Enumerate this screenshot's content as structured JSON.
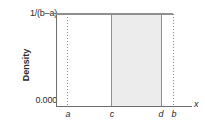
{
  "chart_data": {
    "type": "area",
    "title": "",
    "xlabel": "x",
    "ylabel": "Density",
    "ylim": [
      0,
      1
    ],
    "xlim": [
      0,
      1
    ],
    "grid": false,
    "legend": null,
    "y_ticks": [
      {
        "value": 0,
        "label": "0.000"
      },
      {
        "value": 1,
        "label": "1/(b–a)"
      }
    ],
    "x_ticks": [
      {
        "key": "a",
        "label": "a",
        "position": 0.09
      },
      {
        "key": "c",
        "label": "c",
        "position": 0.42
      },
      {
        "key": "d",
        "label": "d",
        "position": 0.79
      },
      {
        "key": "b",
        "label": "b",
        "position": 0.88
      }
    ],
    "series": [
      {
        "name": "uniform-density",
        "kind": "line",
        "description": "Constant density 1/(b–a) from a to b",
        "x": [
          "a",
          "b"
        ],
        "values": [
          1,
          1
        ]
      },
      {
        "name": "shaded-probability-region",
        "kind": "area",
        "description": "Shaded area between c and d representing P(c < X < d)",
        "x": [
          "c",
          "d"
        ],
        "values": [
          1,
          1
        ],
        "fill_color": "#ececec"
      }
    ],
    "reference_lines": [
      {
        "at": "a",
        "style": "dotted",
        "color": "#8a8a8a"
      },
      {
        "at": "c",
        "style": "solid",
        "color": "#8f8f8f"
      },
      {
        "at": "d",
        "style": "solid",
        "color": "#8f8f8f"
      },
      {
        "at": "b",
        "style": "dotted",
        "color": "#8a8a8a"
      }
    ],
    "colors": {
      "background": "#ffffff",
      "axis": "#6e6e6e",
      "line": "#8f8f8f",
      "shade": "#ececec",
      "text": "#2b2b2b"
    }
  },
  "axes": {
    "y_top_label": "1/(b–a)",
    "y_bottom_label": "0.000",
    "y_axis_title": "Density",
    "x_axis_title": "x"
  },
  "ticks": {
    "a": "a",
    "c": "c",
    "d": "d",
    "b": "b"
  }
}
